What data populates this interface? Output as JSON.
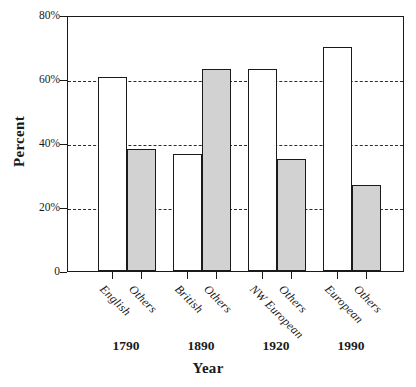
{
  "chart_data": {
    "type": "bar",
    "title": "",
    "xlabel": "Year",
    "ylabel": "Percent",
    "ylim": [
      0,
      80
    ],
    "yticks": [
      0,
      20,
      40,
      60,
      80
    ],
    "ytick_labels": [
      "0",
      "20%",
      "40%",
      "60%",
      "80%"
    ],
    "grid": "horizontal dashed gridlines at 20%, 40%, 60%",
    "legend": "none",
    "groups": [
      "1790",
      "1890",
      "1920",
      "1990"
    ],
    "categories": [
      "English",
      "Others",
      "British",
      "Others",
      "NW European",
      "Others",
      "European",
      "Others"
    ],
    "values": [
      60.5,
      38,
      36.5,
      63,
      63,
      35,
      70,
      27
    ],
    "bars": [
      {
        "group": "1790",
        "label": "English",
        "value": 60.5,
        "fill": "white"
      },
      {
        "group": "1790",
        "label": "Others",
        "value": 38,
        "fill": "gray"
      },
      {
        "group": "1890",
        "label": "British",
        "value": 36.5,
        "fill": "white"
      },
      {
        "group": "1890",
        "label": "Others",
        "value": 63,
        "fill": "gray"
      },
      {
        "group": "1920",
        "label": "NW European",
        "value": 63,
        "fill": "white"
      },
      {
        "group": "1920",
        "label": "Others",
        "value": 35,
        "fill": "gray"
      },
      {
        "group": "1990",
        "label": "European",
        "value": 70,
        "fill": "white"
      },
      {
        "group": "1990",
        "label": "Others",
        "value": 27,
        "fill": "gray"
      }
    ],
    "colors": {
      "bar_white": "#ffffff",
      "bar_gray": "#d2d2d2",
      "outline": "#1a1a1a",
      "gridline": "#2b2b2b",
      "background": "#ffffff"
    }
  }
}
